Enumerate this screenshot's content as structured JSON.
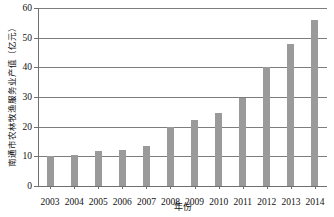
{
  "chart_data": {
    "type": "bar",
    "title": "",
    "xlabel": "年份",
    "ylabel": "南通市农林牧渔服务业产值（亿元）",
    "categories": [
      "2003",
      "2004",
      "2005",
      "2006",
      "2007",
      "2008",
      "2009",
      "2010",
      "2011",
      "2012",
      "2013",
      "2014"
    ],
    "values": [
      10.0,
      10.5,
      11.8,
      12.3,
      13.6,
      20.0,
      22.3,
      24.7,
      29.7,
      40.0,
      48.0,
      56.0
    ],
    "ylim": [
      0,
      60
    ],
    "yticks": [
      0,
      10,
      20,
      30,
      40,
      50,
      60
    ],
    "ytick_labels": [
      "0",
      "10",
      "20",
      "30",
      "40",
      "50",
      "60"
    ],
    "grid": true,
    "legend": "none",
    "series": [
      {
        "name": "南通市农林牧渔服务业产值",
        "values": [
          10.0,
          10.5,
          11.8,
          12.3,
          13.6,
          20.0,
          22.3,
          24.7,
          29.7,
          40.0,
          48.0,
          56.0
        ]
      }
    ],
    "colors": {
      "bar": "#9a9a9a",
      "grid": "#7d7d7d",
      "axis": "#6f6f6f",
      "text": "#111111",
      "background": "#ffffff"
    }
  }
}
